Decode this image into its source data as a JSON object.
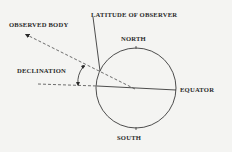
{
  "diagram": {
    "labels": {
      "observed_body": "OBSERVED BODY",
      "latitude_of_observer": "LATITUDE OF OBSERVER",
      "north": "NORTH",
      "declination": "DECLINATION",
      "equator": "EQUATOR",
      "south": "SOUTH"
    },
    "colors": {
      "background": "#f4f4f2",
      "line": "#3a3a3a",
      "text": "#2a2a2a"
    }
  }
}
